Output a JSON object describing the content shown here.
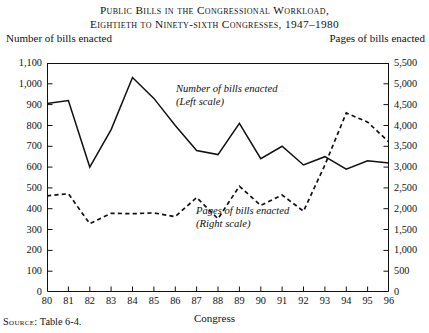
{
  "title": {
    "line1": "Public Bills in the Congressional Workload,",
    "line2": "Eightieth to Ninety-sixth Congresses, 1947–1980"
  },
  "axis_captions": {
    "left": "Number of bills enacted",
    "right": "Pages of bills enacted"
  },
  "annotations": {
    "solid_line1": "Number of bills enacted",
    "solid_line2": "(Left scale)",
    "dashed_line1": "Pages of bills enacted",
    "dashed_line2": "(Right scale)"
  },
  "xaxis_title": "Congress",
  "source": {
    "label": "Source:",
    "text": "Table 6-4."
  },
  "colors": {
    "line": "#111111",
    "axis": "#111111",
    "background": "#ffffff"
  },
  "chart_data": {
    "type": "line",
    "title": "Public Bills in the Congressional Workload, Eightieth to Ninety-sixth Congresses, 1947–1980",
    "xlabel": "Congress",
    "grid": false,
    "legend": "inline-annotations",
    "categories": [
      "80",
      "81",
      "82",
      "83",
      "84",
      "85",
      "86",
      "87",
      "88",
      "89",
      "90",
      "91",
      "92",
      "93",
      "94",
      "95",
      "96"
    ],
    "x_tick_labels": [
      "80",
      "81",
      "82",
      "83",
      "84",
      "85",
      "86",
      "87",
      "88",
      "89",
      "90",
      "91",
      "92",
      "93",
      "94",
      "95",
      "96"
    ],
    "left_axis": {
      "label": "Number of bills enacted",
      "ylim": [
        0,
        1100
      ],
      "ticks": [
        0,
        100,
        200,
        300,
        400,
        500,
        600,
        700,
        800,
        900,
        1000,
        1100
      ],
      "tick_labels": [
        "0",
        "100",
        "200",
        "300",
        "400",
        "500",
        "600",
        "700",
        "800",
        "900",
        "1,000",
        "1,100"
      ]
    },
    "right_axis": {
      "label": "Pages of bills enacted",
      "ylim": [
        0,
        5500
      ],
      "ticks": [
        0,
        500,
        1000,
        1500,
        2000,
        2500,
        3000,
        3500,
        4000,
        4500,
        5000,
        5500
      ],
      "tick_labels": [
        "0",
        "500",
        "1,000",
        "1,500",
        "2,000",
        "2,500",
        "3,000",
        "3,500",
        "4,000",
        "4,500",
        "5,000",
        "5,500"
      ]
    },
    "series": [
      {
        "name": "Number of bills enacted",
        "scale": "left",
        "style": "solid",
        "values": [
          905,
          920,
          600,
          780,
          1030,
          930,
          800,
          680,
          660,
          810,
          640,
          700,
          610,
          650,
          590,
          630,
          620
        ]
      },
      {
        "name": "Pages of bills enacted",
        "scale": "right",
        "style": "dashed",
        "values": [
          2310,
          2360,
          1640,
          1890,
          1880,
          1900,
          1810,
          2270,
          1760,
          2540,
          2080,
          2330,
          1940,
          3050,
          4300,
          4080,
          3600
        ]
      }
    ]
  }
}
